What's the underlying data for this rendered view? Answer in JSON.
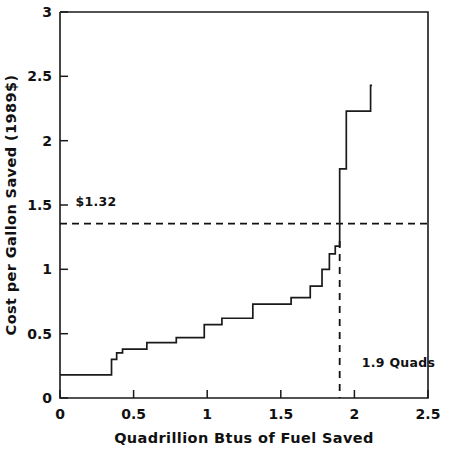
{
  "chart_data": {
    "type": "line",
    "subtype": "step-post",
    "title": "",
    "xlabel": "Quadrillion Btus of Fuel Saved",
    "ylabel": "Cost per Gallon Saved (1989$)",
    "xlim": [
      0,
      2.5
    ],
    "ylim": [
      0,
      3
    ],
    "xticks": [
      0,
      0.5,
      1,
      1.5,
      2,
      2.5
    ],
    "xticklabels": [
      "0",
      "0.5",
      "1",
      "1.5",
      "2",
      "2.5"
    ],
    "yticks": [
      0,
      0.5,
      1,
      1.5,
      2,
      2.5,
      3
    ],
    "yticklabels": [
      "0",
      "0.5",
      "1",
      "1.5",
      "2",
      "2.5",
      "3"
    ],
    "grid": false,
    "legend": null,
    "series": [
      {
        "name": "Supply curve of conserved fuel",
        "style": "solid",
        "color": "#1a1a1a",
        "steps": [
          {
            "x_start": 0.0,
            "x_end": 0.35,
            "y": 0.18
          },
          {
            "x_start": 0.35,
            "x_end": 0.385,
            "y": 0.3
          },
          {
            "x_start": 0.385,
            "x_end": 0.425,
            "y": 0.35
          },
          {
            "x_start": 0.425,
            "x_end": 0.59,
            "y": 0.38
          },
          {
            "x_start": 0.59,
            "x_end": 0.79,
            "y": 0.43
          },
          {
            "x_start": 0.79,
            "x_end": 0.98,
            "y": 0.47
          },
          {
            "x_start": 0.98,
            "x_end": 1.1,
            "y": 0.57
          },
          {
            "x_start": 1.1,
            "x_end": 1.31,
            "y": 0.62
          },
          {
            "x_start": 1.31,
            "x_end": 1.57,
            "y": 0.73
          },
          {
            "x_start": 1.57,
            "x_end": 1.7,
            "y": 0.78
          },
          {
            "x_start": 1.7,
            "x_end": 1.78,
            "y": 0.87
          },
          {
            "x_start": 1.78,
            "x_end": 1.83,
            "y": 1.0
          },
          {
            "x_start": 1.83,
            "x_end": 1.87,
            "y": 1.12
          },
          {
            "x_start": 1.87,
            "x_end": 1.9,
            "y": 1.18
          },
          {
            "x_start": 1.9,
            "x_end": 1.945,
            "y": 1.78
          },
          {
            "x_start": 1.945,
            "x_end": 2.11,
            "y": 2.23
          },
          {
            "x_start": 2.11,
            "x_end": 2.12,
            "y": 2.43
          }
        ]
      }
    ],
    "annotations": [
      {
        "name": "price-line",
        "kind": "hline",
        "y": 1.355,
        "style": "dashed",
        "label": "$1.32",
        "label_x": 0.105,
        "label_y": 1.49
      },
      {
        "name": "quantity-line",
        "kind": "vline",
        "x": 1.9,
        "y_top": 1.22,
        "y_bottom": 0.0,
        "style": "dashed",
        "label": "1.9 Quads",
        "label_x": 2.05,
        "label_y": 0.24
      }
    ]
  },
  "axes": {
    "x_title": "Quadrillion Btus of Fuel Saved",
    "y_title": "Cost per Gallon Saved (1989$)",
    "x_tick_0": "0",
    "x_tick_1": "0.5",
    "x_tick_2": "1",
    "x_tick_3": "1.5",
    "x_tick_4": "2",
    "x_tick_5": "2.5",
    "y_tick_0": "0",
    "y_tick_1": "0.5",
    "y_tick_2": "1",
    "y_tick_3": "1.5",
    "y_tick_4": "2",
    "y_tick_5": "2.5",
    "y_tick_6": "3"
  },
  "annotations": {
    "price_label": "$1.32",
    "quantity_label": "1.9 Quads"
  },
  "colors": {
    "background": "#ffffff",
    "axis": "#1a1a1a",
    "curve": "#1a1a1a",
    "dash": "#111111"
  }
}
